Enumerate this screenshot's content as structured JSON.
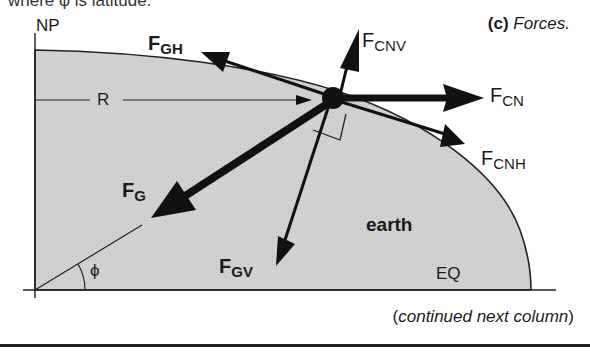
{
  "header": {
    "cut_text": "where φ is latitude."
  },
  "caption": {
    "part": "(c)",
    "title": "Forces."
  },
  "labels": {
    "np": "NP",
    "eq": "EQ",
    "r": "R",
    "earth": "earth",
    "phi": "ϕ",
    "fgh": {
      "main": "F",
      "sub": "GH"
    },
    "fcnv": {
      "main": "F",
      "sub": "CNV"
    },
    "fcn": {
      "main": "F",
      "sub": "CN"
    },
    "fcnh": {
      "main": "F",
      "sub": "CNH"
    },
    "fg": {
      "main": "F",
      "sub": "G"
    },
    "fgv": {
      "main": "F",
      "sub": "GV"
    }
  },
  "footer": {
    "note_open": "(",
    "note": "continued next column",
    "note_close": ")"
  },
  "colors": {
    "earth_fill": "#cfcfcf",
    "ink": "#111111"
  }
}
